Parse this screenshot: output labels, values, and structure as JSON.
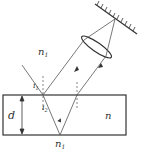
{
  "diagram": {
    "labels": {
      "medium_top": "n",
      "medium_top_sub": "1",
      "slab": "n",
      "medium_bottom": "n",
      "medium_bottom_sub": "1",
      "thickness": "d",
      "incidence_angle": "i",
      "incidence_angle_sub": "1",
      "refraction_angle": "i",
      "refraction_angle_sub": "2"
    },
    "colors": {
      "line": "#333333",
      "ray": "#555555"
    }
  }
}
